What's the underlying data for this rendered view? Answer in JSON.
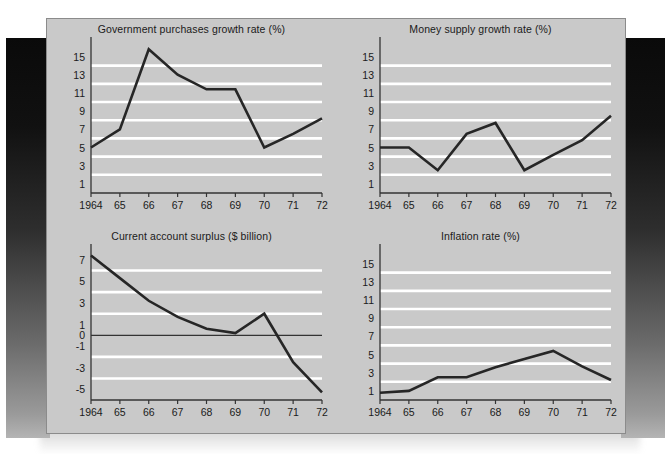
{
  "figure": {
    "panel_background": "#c9c9c9",
    "gridline_color": "#ffffff",
    "line_color": "#262626",
    "axis_color": "#333333",
    "text_color": "#1a1a1a"
  },
  "chart_data": [
    {
      "id": "government-purchases",
      "type": "line",
      "title": "Government purchases growth rate (%)",
      "xlabel": "",
      "ylabel": "",
      "categories": [
        "1964",
        "65",
        "66",
        "67",
        "68",
        "69",
        "70",
        "71",
        "72"
      ],
      "x": [
        1964,
        1965,
        1966,
        1967,
        1968,
        1969,
        1970,
        1971,
        1972
      ],
      "values": [
        5.0,
        7.0,
        15.8,
        13.0,
        11.4,
        11.4,
        5.0,
        6.5,
        8.2
      ],
      "ytick_labels": [
        "15",
        "13",
        "11",
        "9",
        "7",
        "5",
        "3",
        "1"
      ],
      "yticks": [
        15,
        13,
        11,
        9,
        7,
        5,
        3,
        1
      ],
      "gridlines": [
        14,
        12,
        10,
        8,
        6,
        4,
        2
      ],
      "ylim": [
        0,
        16.6
      ],
      "zero_line": null,
      "grid": true,
      "legend": "none"
    },
    {
      "id": "money-supply",
      "type": "line",
      "title": "Money supply growth rate (%)",
      "xlabel": "",
      "ylabel": "",
      "categories": [
        "1964",
        "65",
        "66",
        "67",
        "68",
        "69",
        "70",
        "71",
        "72"
      ],
      "x": [
        1964,
        1965,
        1966,
        1967,
        1968,
        1969,
        1970,
        1971,
        1972
      ],
      "values": [
        5.0,
        5.0,
        2.5,
        6.5,
        7.7,
        2.5,
        4.2,
        5.8,
        8.5
      ],
      "ytick_labels": [
        "15",
        "13",
        "11",
        "9",
        "7",
        "5",
        "3",
        "1"
      ],
      "yticks": [
        15,
        13,
        11,
        9,
        7,
        5,
        3,
        1
      ],
      "gridlines": [
        14,
        12,
        10,
        8,
        6,
        4,
        2
      ],
      "ylim": [
        0,
        16.6
      ],
      "zero_line": null,
      "grid": true,
      "legend": "none"
    },
    {
      "id": "current-account-surplus",
      "type": "line",
      "title": "Current account surplus ($ billion)",
      "xlabel": "",
      "ylabel": "",
      "categories": [
        "1964",
        "65",
        "66",
        "67",
        "68",
        "69",
        "70",
        "71",
        "72"
      ],
      "x": [
        1964,
        1965,
        1966,
        1967,
        1968,
        1969,
        1970,
        1971,
        1972
      ],
      "values": [
        7.4,
        5.3,
        3.2,
        1.7,
        0.6,
        0.2,
        2.0,
        -2.5,
        -5.3
      ],
      "ytick_labels": [
        "7",
        "5",
        "3",
        "1",
        "0",
        "-1",
        "-3",
        "-5"
      ],
      "yticks": [
        7,
        5,
        3,
        1,
        0,
        -1,
        -3,
        -5
      ],
      "gridlines": [
        6,
        4,
        2,
        -2,
        -4
      ],
      "ylim": [
        -6.0,
        8.0
      ],
      "zero_line": 0,
      "grid": true,
      "legend": "none"
    },
    {
      "id": "inflation-rate",
      "type": "line",
      "title": "Inflation rate (%)",
      "xlabel": "",
      "ylabel": "",
      "categories": [
        "1964",
        "65",
        "66",
        "67",
        "68",
        "69",
        "70",
        "71",
        "72"
      ],
      "x": [
        1964,
        1965,
        1966,
        1967,
        1968,
        1969,
        1970,
        1971,
        1972
      ],
      "values": [
        0.8,
        1.0,
        2.5,
        2.5,
        3.6,
        4.5,
        5.4,
        3.7,
        2.2
      ],
      "ytick_labels": [
        "15",
        "13",
        "11",
        "9",
        "7",
        "5",
        "3",
        "1"
      ],
      "yticks": [
        15,
        13,
        11,
        9,
        7,
        5,
        3,
        1
      ],
      "gridlines": [
        14,
        12,
        10,
        8,
        6,
        4,
        2
      ],
      "ylim": [
        0,
        16.6
      ],
      "zero_line": null,
      "grid": true,
      "legend": "none"
    }
  ]
}
